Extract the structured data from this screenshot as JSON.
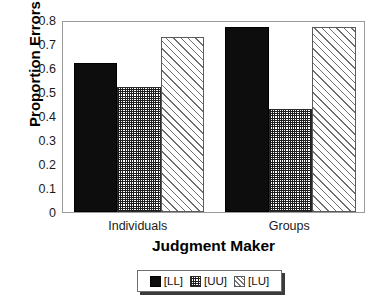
{
  "chart_data": {
    "type": "bar",
    "title": "",
    "xlabel": "Judgment Maker",
    "ylabel": "Proportion Errors",
    "categories": [
      "Individuals",
      "Groups"
    ],
    "series": [
      {
        "name": "[LL]",
        "values": [
          0.62,
          0.77
        ],
        "fill": "solid"
      },
      {
        "name": "[UU]",
        "values": [
          0.52,
          0.43
        ],
        "fill": "grid"
      },
      {
        "name": "[LU]",
        "values": [
          0.73,
          0.77
        ],
        "fill": "diag"
      }
    ],
    "ylim": [
      0,
      0.8
    ],
    "ytick_labels": [
      "0.8",
      "0.7",
      "0.6",
      "0.5",
      "0.4",
      "0.3",
      "0.2",
      "0.1",
      "0"
    ],
    "ytick_values": [
      0.8,
      0.7,
      0.6,
      0.5,
      0.4,
      0.3,
      0.2,
      0.1,
      0
    ],
    "grid": false,
    "legend_position": "bottom",
    "legend_entries": [
      "[LL]",
      "[UU]",
      "[LU]"
    ],
    "bar_grouping": "contiguous"
  },
  "axes": {
    "y_title": "Proportion Errors",
    "x_title": "Judgment Maker"
  }
}
